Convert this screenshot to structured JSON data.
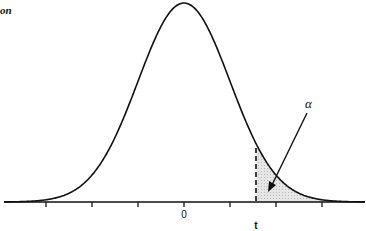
{
  "chart_data": {
    "type": "area",
    "title": "on",
    "distribution": "normal",
    "mean": 0,
    "x_tick_labels": [
      {
        "position": 0,
        "label": "0"
      }
    ],
    "x_ticks_sigma": [
      -3,
      -2,
      -1,
      0,
      1,
      2,
      3
    ],
    "critical_value": {
      "label": "t",
      "position_sigma": 1.57
    },
    "shaded_region": "right tail beyond t",
    "annotation": {
      "label": "α",
      "points_to": "shaded right tail area"
    },
    "xlabel": "",
    "ylabel": "",
    "grid": false,
    "legend": "none"
  },
  "labels": {
    "zero": "0",
    "t": "t",
    "alpha": "α",
    "title_fragment": "on"
  },
  "colors": {
    "line": "#111111",
    "shade": "#dcdcdc"
  }
}
